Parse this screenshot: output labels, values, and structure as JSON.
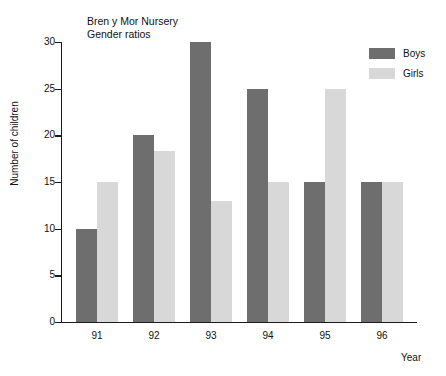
{
  "chart_data": {
    "type": "bar",
    "title": "Bren y Mor Nursery",
    "subtitle": "Gender ratios",
    "xlabel": "Year",
    "ylabel": "Number of children",
    "categories": [
      "91",
      "92",
      "93",
      "94",
      "95",
      "96"
    ],
    "series": [
      {
        "name": "Boys",
        "color": "#6e6e6e",
        "values": [
          10,
          20,
          30,
          25,
          15,
          15
        ]
      },
      {
        "name": "Girls",
        "color": "#d8d8d8",
        "values": [
          15,
          18.3,
          13,
          15,
          25,
          15
        ]
      }
    ],
    "ylim": [
      0,
      30
    ],
    "ytick_step": 5,
    "yticks": [
      "0",
      "5",
      "10",
      "15",
      "20",
      "25",
      "30"
    ],
    "grid": false,
    "legend_position": "top-right"
  },
  "legend": {
    "entries": [
      {
        "label": "Boys"
      },
      {
        "label": "Girls"
      }
    ]
  }
}
